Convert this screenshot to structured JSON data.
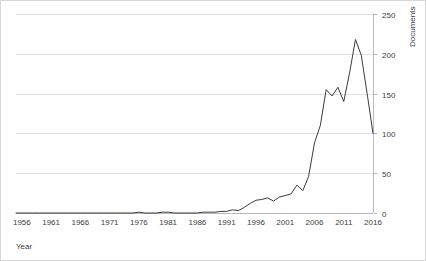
{
  "chart_data": {
    "type": "line",
    "title": "",
    "subtitle": "",
    "xlabel": "Year",
    "ylabel": "Documents",
    "ylabel_position": "right",
    "grid": "horizontal",
    "legend": "none",
    "xlim": [
      1955,
      2016
    ],
    "ylim": [
      0,
      250
    ],
    "ytick_labels": [
      "250",
      "200",
      "150",
      "100",
      "50",
      "0"
    ],
    "ytick_values": [
      250,
      200,
      150,
      100,
      50,
      0
    ],
    "xtick_labels": [
      "1956",
      "1961",
      "1966",
      "1971",
      "1976",
      "1981",
      "1986",
      "1991",
      "1996",
      "2001",
      "2006",
      "2011",
      "2016"
    ],
    "xtick_values": [
      1956,
      1961,
      1966,
      1971,
      1976,
      1981,
      1986,
      1991,
      1996,
      2001,
      2006,
      2011,
      2016
    ],
    "series": [
      {
        "name": "Documents",
        "color": "#3b3b3b",
        "x": [
          1955,
          1956,
          1957,
          1958,
          1959,
          1960,
          1961,
          1962,
          1963,
          1964,
          1965,
          1966,
          1967,
          1968,
          1969,
          1970,
          1971,
          1972,
          1973,
          1974,
          1975,
          1976,
          1977,
          1978,
          1979,
          1980,
          1981,
          1982,
          1983,
          1984,
          1985,
          1986,
          1987,
          1988,
          1989,
          1990,
          1991,
          1992,
          1993,
          1994,
          1995,
          1996,
          1997,
          1998,
          1999,
          2000,
          2001,
          2002,
          2003,
          2004,
          2005,
          2006,
          2007,
          2008,
          2009,
          2010,
          2011,
          2012,
          2013,
          2014,
          2015,
          2016
        ],
        "values": [
          0,
          0,
          0,
          0,
          0,
          0,
          0,
          0,
          0,
          0,
          0,
          0,
          0,
          0,
          0,
          0,
          0,
          0,
          0,
          0,
          0,
          1,
          0,
          0,
          0,
          1,
          1,
          0,
          0,
          0,
          0,
          0,
          1,
          1,
          1,
          2,
          2,
          4,
          3,
          7,
          12,
          16,
          17,
          19,
          15,
          20,
          22,
          24,
          35,
          28,
          46,
          88,
          110,
          155,
          147,
          158,
          140,
          176,
          218,
          198,
          150,
          100
        ]
      }
    ]
  },
  "axis": {
    "x_title": "Year",
    "y_title": "Documents"
  }
}
